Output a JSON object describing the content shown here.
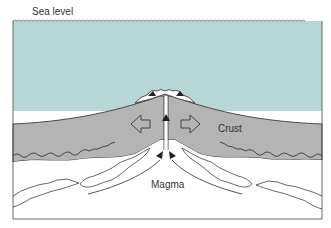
{
  "diagram": {
    "type": "cross-section",
    "labels": {
      "sea_level": "Sea level",
      "crust": "Crust",
      "magma": "Magma"
    },
    "colors": {
      "sea": "#b7d6d6",
      "crust": "#b4b4b4",
      "magma_background": "#ffffff",
      "outline": "#2a2a2a",
      "sea_surface_line": "#555555"
    },
    "arrows": [
      {
        "id": "spread-left",
        "direction": "left",
        "style": "hollow block"
      },
      {
        "id": "spread-right",
        "direction": "right",
        "style": "hollow block"
      },
      {
        "id": "magma-rise-left",
        "direction": "up-right",
        "style": "curved line"
      },
      {
        "id": "magma-rise-right",
        "direction": "up-left",
        "style": "curved line"
      }
    ]
  }
}
